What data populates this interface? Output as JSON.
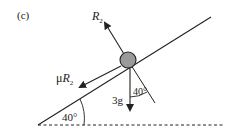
{
  "diagram": {
    "part_label": "(c)",
    "forces": {
      "normal": {
        "label_main": "R",
        "label_sub": "2"
      },
      "friction": {
        "label_prefix": "μ",
        "label_main": "R",
        "label_sub": "2"
      },
      "weight": {
        "label": "3g"
      }
    },
    "angles": {
      "incline": "40°",
      "weight_to_normal": "40°"
    },
    "colors": {
      "line": "#222222",
      "ball_fill": "#9a9a9a",
      "ball_stroke": "#222222",
      "background": "#ffffff"
    }
  }
}
